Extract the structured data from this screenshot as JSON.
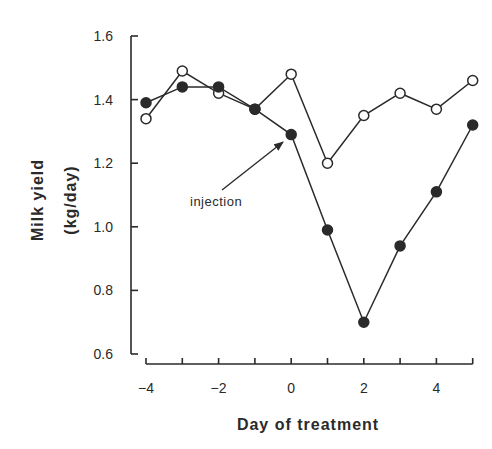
{
  "chart_data": {
    "type": "line",
    "title": "",
    "xlabel": "Day of treatment",
    "ylabel": "Milk yield (kg/day)",
    "ylabel_lines": [
      "Milk yield",
      "(kg/day)"
    ],
    "x": [
      -4,
      -3,
      -2,
      -1,
      0,
      1,
      2,
      3,
      4,
      5
    ],
    "xlim": [
      -4,
      5
    ],
    "ylim": [
      0.6,
      1.6
    ],
    "x_ticks": [
      -4,
      -3,
      -2,
      -1,
      0,
      1,
      2,
      3,
      4,
      5
    ],
    "x_tick_labels": [
      "-4",
      "",
      "-2",
      "",
      "0",
      "",
      "2",
      "",
      "4",
      ""
    ],
    "y_ticks": [
      0.6,
      0.8,
      1.0,
      1.2,
      1.4,
      1.6
    ],
    "y_tick_labels": [
      "0.6",
      "0.8",
      "1.0",
      "1.2",
      "1.4",
      "1.6"
    ],
    "grid": false,
    "legend": null,
    "series": [
      {
        "name": "open circles",
        "marker": "open-circle",
        "values": [
          1.34,
          1.49,
          1.42,
          1.37,
          1.48,
          1.2,
          1.35,
          1.42,
          1.37,
          1.46
        ]
      },
      {
        "name": "filled circles",
        "marker": "filled-circle",
        "values": [
          1.39,
          1.44,
          1.44,
          1.37,
          1.29,
          0.99,
          0.7,
          0.94,
          1.11,
          1.32
        ]
      }
    ],
    "annotations": [
      {
        "text": "injection",
        "arrow_to": {
          "x": 0,
          "y": 1.29
        }
      }
    ]
  },
  "colors": {
    "ink": "#2a2a2a",
    "background": "#ffffff"
  }
}
